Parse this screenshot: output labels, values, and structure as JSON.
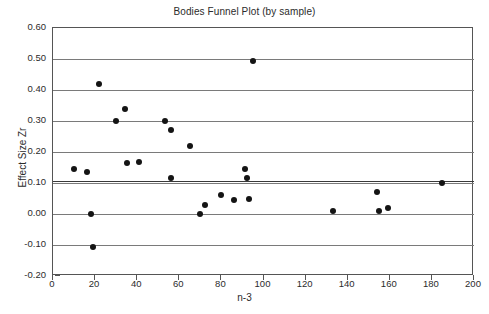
{
  "chart_data": {
    "type": "scatter",
    "title": "Bodies Funnel Plot (by sample)",
    "xlabel": "n-3",
    "ylabel": "Effect Size Zr",
    "xlim": [
      0,
      200
    ],
    "ylim": [
      -0.2,
      0.6
    ],
    "xticks": [
      0,
      20,
      40,
      60,
      80,
      100,
      120,
      140,
      160,
      180,
      200
    ],
    "xtick_labels": [
      "0",
      "20",
      "40",
      "60",
      "80",
      "100",
      "120",
      "140",
      "160",
      "180",
      "200"
    ],
    "yticks": [
      -0.2,
      -0.1,
      0.0,
      0.1,
      0.2,
      0.3,
      0.4,
      0.5,
      0.6
    ],
    "ytick_labels": [
      "-0.20",
      "-0.10",
      "0.00",
      "0.10",
      "0.20",
      "0.30",
      "0.40",
      "0.50",
      "0.60"
    ],
    "grid": "horizontal",
    "legend": "none",
    "mean_line": 0.108,
    "marker_color": "#141414",
    "gridline_color": "#7a7a7a",
    "points": [
      {
        "x": 10,
        "y": 0.145
      },
      {
        "x": 16,
        "y": 0.135
      },
      {
        "x": 18,
        "y": 0.0
      },
      {
        "x": 19,
        "y": -0.105
      },
      {
        "x": 22,
        "y": 0.42
      },
      {
        "x": 30,
        "y": 0.3
      },
      {
        "x": 34,
        "y": 0.34
      },
      {
        "x": 35,
        "y": 0.165
      },
      {
        "x": 41,
        "y": 0.167
      },
      {
        "x": 53,
        "y": 0.3
      },
      {
        "x": 56,
        "y": 0.27
      },
      {
        "x": 56,
        "y": 0.115
      },
      {
        "x": 65,
        "y": 0.22
      },
      {
        "x": 70,
        "y": 0.0
      },
      {
        "x": 72,
        "y": 0.03
      },
      {
        "x": 80,
        "y": 0.06
      },
      {
        "x": 86,
        "y": 0.045
      },
      {
        "x": 91,
        "y": 0.145
      },
      {
        "x": 92,
        "y": 0.115
      },
      {
        "x": 93,
        "y": 0.05
      },
      {
        "x": 95,
        "y": 0.495
      },
      {
        "x": 133,
        "y": 0.01
      },
      {
        "x": 154,
        "y": 0.07
      },
      {
        "x": 155,
        "y": 0.01
      },
      {
        "x": 159,
        "y": 0.02
      },
      {
        "x": 185,
        "y": 0.1
      }
    ]
  }
}
